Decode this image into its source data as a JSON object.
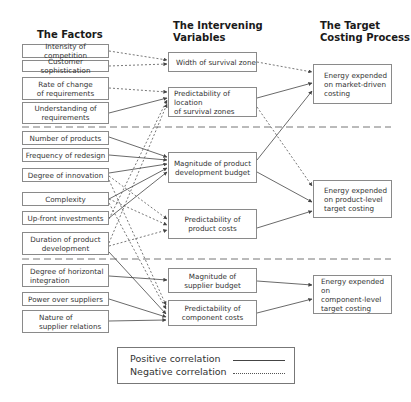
{
  "headers": {
    "factors": "The Factors",
    "intervening_1": "The Intervening",
    "intervening_2": "Variables",
    "target_1": "The Target",
    "target_2": "Costing Process"
  },
  "factors": [
    {
      "id": "f1",
      "lines": [
        "Intensity of competition"
      ]
    },
    {
      "id": "f2",
      "lines": [
        "Customer sophistication"
      ]
    },
    {
      "id": "f3",
      "lines": [
        "Rate of change",
        "of requirements"
      ]
    },
    {
      "id": "f4",
      "lines": [
        "Understanding of",
        "requirements"
      ]
    },
    {
      "id": "f5",
      "lines": [
        "Number of products"
      ]
    },
    {
      "id": "f6",
      "lines": [
        "Frequency of redesign"
      ]
    },
    {
      "id": "f7",
      "lines": [
        "Degree of innovation"
      ]
    },
    {
      "id": "f8",
      "lines": [
        "Complexity"
      ]
    },
    {
      "id": "f9",
      "lines": [
        "Up-front investments"
      ]
    },
    {
      "id": "f10",
      "lines": [
        "Duration of product",
        "development"
      ]
    },
    {
      "id": "f11",
      "lines": [
        "Degree of horizontal",
        "integration"
      ]
    },
    {
      "id": "f12",
      "lines": [
        "Power over suppliers"
      ]
    },
    {
      "id": "f13",
      "lines": [
        "Nature of",
        "supplier relations"
      ]
    }
  ],
  "intervening": [
    {
      "id": "v1",
      "lines": [
        "Width of survival zone"
      ]
    },
    {
      "id": "v2",
      "lines": [
        "Predictability of location",
        "of survival zones"
      ]
    },
    {
      "id": "v3",
      "lines": [
        "Magnitude of product",
        "development budget"
      ]
    },
    {
      "id": "v4",
      "lines": [
        "Predictability of",
        "product costs"
      ]
    },
    {
      "id": "v5",
      "lines": [
        "Magnitude of",
        "supplier budget"
      ]
    },
    {
      "id": "v6",
      "lines": [
        "Predictability of",
        "component costs"
      ]
    }
  ],
  "targets": [
    {
      "id": "t1",
      "lines": [
        "Energy expended",
        "on market-driven",
        "costing"
      ]
    },
    {
      "id": "t2",
      "lines": [
        "Energy expended",
        "on product-level",
        "target costing"
      ]
    },
    {
      "id": "t3",
      "lines": [
        "Energy expended on",
        "component-level",
        "target costing"
      ]
    }
  ],
  "legend": {
    "positive": "Positive correlation",
    "negative": "Negative correlation"
  },
  "relations": [
    {
      "from": "f1",
      "to": "v1",
      "type": "negative"
    },
    {
      "from": "f2",
      "to": "v1",
      "type": "negative"
    },
    {
      "from": "f3",
      "to": "v2",
      "type": "negative"
    },
    {
      "from": "f4",
      "to": "v2",
      "type": "positive"
    },
    {
      "from": "f9",
      "to": "v2",
      "type": "negative"
    },
    {
      "from": "f10",
      "to": "v2",
      "type": "negative"
    },
    {
      "from": "f5",
      "to": "v3",
      "type": "positive"
    },
    {
      "from": "f6",
      "to": "v3",
      "type": "positive"
    },
    {
      "from": "f7",
      "to": "v3",
      "type": "positive"
    },
    {
      "from": "f8",
      "to": "v3",
      "type": "positive"
    },
    {
      "from": "f9",
      "to": "v3",
      "type": "positive"
    },
    {
      "from": "f7",
      "to": "v4",
      "type": "negative"
    },
    {
      "from": "f8",
      "to": "v4",
      "type": "negative"
    },
    {
      "from": "f10",
      "to": "v4",
      "type": "negative"
    },
    {
      "from": "f7",
      "to": "v6",
      "type": "negative"
    },
    {
      "from": "f8",
      "to": "v6",
      "type": "negative"
    },
    {
      "from": "f10",
      "to": "v6",
      "type": "positive"
    },
    {
      "from": "f11",
      "to": "v5",
      "type": "positive"
    },
    {
      "from": "f12",
      "to": "v6",
      "type": "positive"
    },
    {
      "from": "f13",
      "to": "v6",
      "type": "positive"
    },
    {
      "from": "v1",
      "to": "t1",
      "type": "negative"
    },
    {
      "from": "v2",
      "to": "t1",
      "type": "positive"
    },
    {
      "from": "v2",
      "to": "t2",
      "type": "negative"
    },
    {
      "from": "v3",
      "to": "t1",
      "type": "positive"
    },
    {
      "from": "v3",
      "to": "t2",
      "type": "positive"
    },
    {
      "from": "v4",
      "to": "t2",
      "type": "positive"
    },
    {
      "from": "v5",
      "to": "t3",
      "type": "positive"
    },
    {
      "from": "v6",
      "to": "t3",
      "type": "positive"
    }
  ]
}
